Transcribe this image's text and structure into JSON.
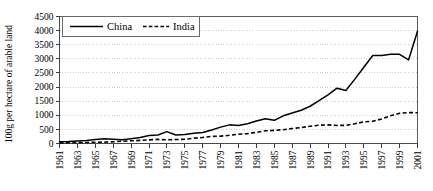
{
  "chart_data": {
    "type": "line",
    "title": "",
    "subtitle": "",
    "xlabel": "",
    "ylabel": "100g per hectare of arable land",
    "xlim": [
      1961,
      2001
    ],
    "ylim": [
      0,
      4500
    ],
    "ytick_step": 500,
    "xtick_step": 2,
    "grid": true,
    "grid_axis": "y",
    "legend_position": "top-left-inside",
    "yticks": [
      0,
      500,
      1000,
      1500,
      2000,
      2500,
      3000,
      3500,
      4000,
      4500
    ],
    "ytick_labels": [
      "0",
      "500",
      "1000",
      "1500",
      "2000",
      "2500",
      "3000",
      "3500",
      "4000",
      "4500"
    ],
    "x": [
      1961,
      1962,
      1963,
      1964,
      1965,
      1966,
      1967,
      1968,
      1969,
      1970,
      1971,
      1972,
      1973,
      1974,
      1975,
      1976,
      1977,
      1978,
      1979,
      1980,
      1981,
      1982,
      1983,
      1984,
      1985,
      1986,
      1987,
      1988,
      1989,
      1990,
      1991,
      1992,
      1993,
      1994,
      1995,
      1996,
      1997,
      1998,
      1999,
      2000,
      2001
    ],
    "xtick_labels": [
      "1961",
      "1963",
      "1965",
      "1967",
      "1969",
      "1971",
      "1973",
      "1975",
      "1977",
      "1979",
      "1981",
      "1983",
      "1985",
      "1987",
      "1989",
      "1991",
      "1993",
      "1995",
      "1997",
      "1999",
      "2001"
    ],
    "series": [
      {
        "name": "China",
        "style": "solid",
        "color": "#000000",
        "values": [
          60,
          70,
          90,
          110,
          140,
          170,
          150,
          130,
          170,
          215,
          280,
          300,
          420,
          300,
          320,
          360,
          390,
          480,
          580,
          660,
          640,
          700,
          800,
          880,
          820,
          980,
          1080,
          1180,
          1320,
          1520,
          1720,
          1960,
          1880,
          2280,
          2700,
          3120,
          3120,
          3160,
          3160,
          2960,
          3980
        ]
      },
      {
        "name": "India",
        "style": "dashed",
        "color": "#000000",
        "values": [
          20,
          25,
          30,
          35,
          45,
          50,
          60,
          80,
          95,
          110,
          130,
          145,
          130,
          140,
          150,
          185,
          215,
          250,
          260,
          290,
          330,
          350,
          395,
          450,
          465,
          490,
          530,
          565,
          610,
          650,
          660,
          640,
          645,
          700,
          765,
          790,
          870,
          985,
          1070,
          1095,
          1090
        ]
      }
    ]
  },
  "legend": {
    "entries": [
      {
        "label": "China",
        "style": "solid"
      },
      {
        "label": "India",
        "style": "dashed"
      }
    ]
  }
}
